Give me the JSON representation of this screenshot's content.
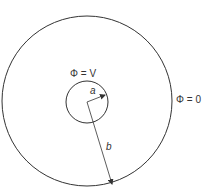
{
  "diagram": {
    "outer_circle": {
      "label": "Φ = 0",
      "cx": 87,
      "cy": 101,
      "r": 85
    },
    "inner_circle": {
      "label": "Φ = V",
      "cx": 87,
      "cy": 102,
      "r": 21
    },
    "radius_inner_label": "a",
    "radius_outer_label": "b",
    "stroke_color": "#333333"
  }
}
